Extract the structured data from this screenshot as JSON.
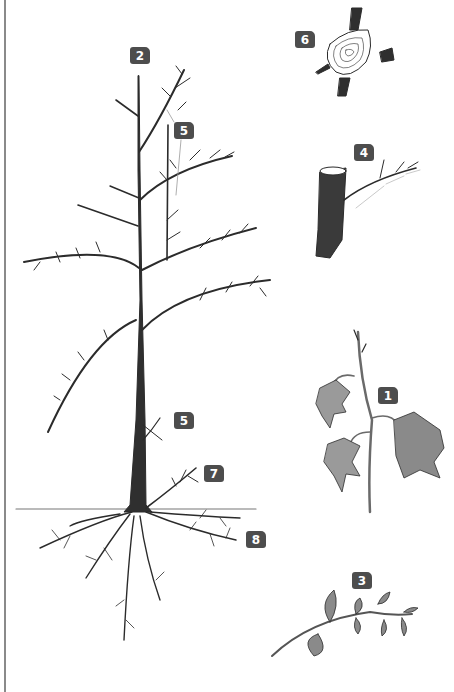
{
  "diagram": {
    "title": "",
    "colors": {
      "badge_bg": "#4d4d4d",
      "badge_text": "#ffffff",
      "ink": "#2b2b2b",
      "leaf_fill": "#9a9a9a",
      "trunk_fill": "#3a3a3a",
      "ground_line": "#777777",
      "frame_line": "#8a8a8a"
    },
    "labels": [
      {
        "id": "2",
        "text": "2",
        "target": "tree-leader-top"
      },
      {
        "id": "5a",
        "text": "5",
        "target": "upper-side-branch"
      },
      {
        "id": "5b",
        "text": "5",
        "target": "lower-trunk-shoot"
      },
      {
        "id": "7",
        "text": "7",
        "target": "sucker-at-base"
      },
      {
        "id": "8",
        "text": "8",
        "target": "root-system"
      },
      {
        "id": "6",
        "text": "6",
        "target": "cut-stump-with-rings"
      },
      {
        "id": "4",
        "text": "4",
        "target": "pruned-branch-stub"
      },
      {
        "id": "1",
        "text": "1",
        "target": "ivy-leaf-shoot"
      },
      {
        "id": "3",
        "text": "3",
        "target": "leafy-twig"
      }
    ]
  }
}
